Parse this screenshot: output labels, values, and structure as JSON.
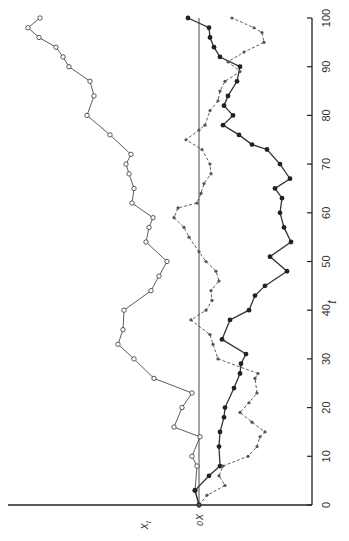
{
  "chart_data": {
    "type": "line",
    "title": "",
    "orientation": "rotated 90 degrees clockwise (t axis vertical, x_t axis horizontal, x_t increases to the left)",
    "xlabel": "t",
    "ylabel": "x_t",
    "y_reference_label": "x0",
    "x_ticks": [
      0,
      10,
      20,
      30,
      40,
      50,
      60,
      70,
      80,
      90,
      100
    ],
    "xlim": [
      0,
      100
    ],
    "ylim": [
      -10,
      19
    ],
    "grid": false,
    "legend": null,
    "series": [
      {
        "name": "open-circle walk",
        "marker": "open-circle",
        "line": "solid",
        "points": [
          [
            0,
            0.0
          ],
          [
            3,
            0.4
          ],
          [
            8,
            0.2
          ],
          [
            10,
            0.7
          ],
          [
            14,
            -0.1
          ],
          [
            16,
            2.5
          ],
          [
            20,
            1.7
          ],
          [
            23,
            0.7
          ],
          [
            26,
            4.5
          ],
          [
            30,
            6.5
          ],
          [
            33,
            8.1
          ],
          [
            36,
            7.6
          ],
          [
            40,
            7.5
          ],
          [
            44,
            4.8
          ],
          [
            47,
            4.0
          ],
          [
            50,
            3.2
          ],
          [
            54,
            5.3
          ],
          [
            57,
            5.0
          ],
          [
            59,
            4.6
          ],
          [
            62,
            6.7
          ],
          [
            65,
            6.5
          ],
          [
            68,
            7.0
          ],
          [
            70,
            7.3
          ],
          [
            72,
            6.8
          ],
          [
            76,
            8.9
          ],
          [
            80,
            11.2
          ],
          [
            84,
            10.5
          ],
          [
            87,
            10.9
          ],
          [
            90,
            13.0
          ],
          [
            92,
            13.6
          ],
          [
            94,
            14.3
          ],
          [
            96,
            16.0
          ],
          [
            98,
            17.1
          ],
          [
            100,
            15.9
          ]
        ]
      },
      {
        "name": "filled-circle walk",
        "marker": "filled-circle",
        "line": "solid-bold",
        "points": [
          [
            0,
            0.0
          ],
          [
            3,
            0.4
          ],
          [
            6,
            -1.0
          ],
          [
            8,
            -2.1
          ],
          [
            12,
            -2.0
          ],
          [
            15,
            -2.1
          ],
          [
            18,
            -2.5
          ],
          [
            20,
            -2.6
          ],
          [
            24,
            -3.5
          ],
          [
            27,
            -4.1
          ],
          [
            29,
            -4.2
          ],
          [
            31,
            -4.7
          ],
          [
            34,
            -2.3
          ],
          [
            38,
            -3.1
          ],
          [
            40,
            -5.0
          ],
          [
            43,
            -5.6
          ],
          [
            45,
            -6.6
          ],
          [
            48,
            -8.8
          ],
          [
            51,
            -7.1
          ],
          [
            54,
            -9.2
          ],
          [
            57,
            -8.5
          ],
          [
            60,
            -8.1
          ],
          [
            63,
            -8.3
          ],
          [
            65,
            -7.6
          ],
          [
            67,
            -9.1
          ],
          [
            70,
            -8.1
          ],
          [
            73,
            -6.8
          ],
          [
            74,
            -5.3
          ],
          [
            76,
            -4.0
          ],
          [
            78,
            -2.4
          ],
          [
            80,
            -3.4
          ],
          [
            82,
            -2.5
          ],
          [
            84,
            -2.9
          ],
          [
            87,
            -3.8
          ],
          [
            90,
            -4.1
          ],
          [
            92,
            -2.1
          ],
          [
            94,
            -1.5
          ],
          [
            96,
            -1.1
          ],
          [
            98,
            -1.0
          ],
          [
            100,
            1.1
          ]
        ]
      },
      {
        "name": "star walk",
        "marker": "star",
        "line": "dashed",
        "points": [
          [
            0,
            0.0
          ],
          [
            2,
            -0.8
          ],
          [
            4,
            -2.6
          ],
          [
            6,
            -2.0
          ],
          [
            8,
            -2.4
          ],
          [
            10,
            -4.9
          ],
          [
            12,
            -5.8
          ],
          [
            14,
            -6.1
          ],
          [
            15,
            -6.6
          ],
          [
            17,
            -5.3
          ],
          [
            19,
            -4.1
          ],
          [
            21,
            -5.0
          ],
          [
            23,
            -5.8
          ],
          [
            26,
            -5.6
          ],
          [
            27,
            -5.9
          ],
          [
            30,
            -1.9
          ],
          [
            33,
            -1.4
          ],
          [
            35,
            -1.1
          ],
          [
            38,
            0.8
          ],
          [
            40,
            -0.7
          ],
          [
            42,
            -1.3
          ],
          [
            44,
            -1.2
          ],
          [
            46,
            -2.0
          ],
          [
            48,
            -1.7
          ],
          [
            50,
            -0.7
          ],
          [
            52,
            0.0
          ],
          [
            55,
            1.0
          ],
          [
            57,
            1.5
          ],
          [
            59,
            2.5
          ],
          [
            61,
            2.1
          ],
          [
            62,
            0.2
          ],
          [
            64,
            -0.2
          ],
          [
            66,
            -0.5
          ],
          [
            68,
            -1.2
          ],
          [
            70,
            -1.1
          ],
          [
            73,
            -0.3
          ],
          [
            75,
            1.3
          ],
          [
            77,
            0.0
          ],
          [
            78,
            -0.6
          ],
          [
            81,
            -1.1
          ],
          [
            83,
            -1.9
          ],
          [
            85,
            -2.1
          ],
          [
            87,
            -2.6
          ],
          [
            89,
            -4.1
          ],
          [
            91,
            -2.9
          ],
          [
            93,
            -4.5
          ],
          [
            95,
            -6.5
          ],
          [
            97,
            -6.3
          ],
          [
            98,
            -5.5
          ],
          [
            100,
            -3.3
          ]
        ]
      }
    ]
  },
  "labels": {
    "t_axis_label": "t",
    "x_axis_label": "x",
    "x_axis_label_sub": "t",
    "x0_label": "x",
    "x0_label_sub": "0"
  }
}
